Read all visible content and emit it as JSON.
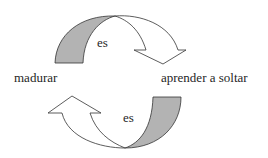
{
  "diagram": {
    "labels": {
      "left": "madurar",
      "right": "aprender a soltar",
      "top_connector": "es",
      "bottom_connector": "es"
    },
    "arrows": [
      {
        "name": "top-arrow",
        "from": "madurar",
        "to": "aprender a soltar",
        "direction": "clockwise-down",
        "label": "es"
      },
      {
        "name": "bottom-arrow",
        "from": "aprender a soltar",
        "to": "madurar",
        "direction": "clockwise-up",
        "label": "es"
      }
    ],
    "colors": {
      "shaded_base": "#b3b3b3",
      "arrow_fill": "#ffffff",
      "stroke": "#333333",
      "text": "#262626"
    }
  }
}
